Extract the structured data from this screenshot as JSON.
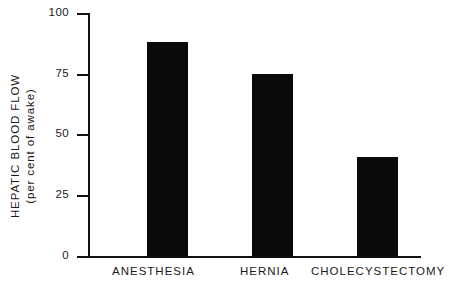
{
  "chart_data": {
    "type": "bar",
    "title": "",
    "xlabel": "",
    "ylabel": "HEPATIC BLOOD FLOW (per cent of awake)",
    "ylabel_line1": "HEPATIC BLOOD FLOW",
    "ylabel_line2": "(per cent of awake)",
    "categories": [
      "ANESTHESIA",
      "HERNIA",
      "CHOLECYSTECTOMY"
    ],
    "values": [
      88,
      75,
      41
    ],
    "ylim": [
      0,
      100
    ],
    "yticks": [
      0,
      25,
      50,
      75,
      100
    ],
    "ytick_labels": [
      "0",
      "25",
      "50",
      "75",
      "100"
    ],
    "grid": false,
    "legend": false,
    "bar_color": "#0a0a0a",
    "axis_color": "#111111",
    "background": "#ffffff"
  },
  "axis": {
    "ticks": [
      {
        "label": "100",
        "value": 100
      },
      {
        "label": "75",
        "value": 75
      },
      {
        "label": "50",
        "value": 50
      },
      {
        "label": "25",
        "value": 25
      },
      {
        "label": "0",
        "value": 0
      }
    ]
  },
  "bars": [
    {
      "label": "ANESTHESIA",
      "value": 88
    },
    {
      "label": "HERNIA",
      "value": 75
    },
    {
      "label": "CHOLECYSTECTOMY",
      "value": 41
    }
  ]
}
